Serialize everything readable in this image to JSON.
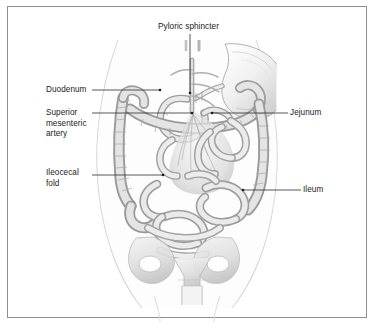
{
  "figure": {
    "kind": "anatomical-illustration",
    "style": "grayscale medical line drawing",
    "frame_color": "#8d8f92",
    "background_color": "#ffffff",
    "text_color": "#1b1b1b",
    "leader_line_color": "#3a3a3a"
  },
  "labels": {
    "pyloric_sphincter": "Pyloric sphincter",
    "duodenum": "Duodenum",
    "superior_mesenteric_artery": "Superior\nmesenteric\nartery",
    "ileocecal_fold": "Ileocecal\nfold",
    "jejunum": "Jejunum",
    "ileum": "Ileum"
  },
  "callouts": [
    {
      "name": "pyloric-sphincter",
      "side": "top",
      "label": "Pyloric sphincter",
      "point_x": 190,
      "point_y": 93
    },
    {
      "name": "duodenum",
      "side": "left",
      "label": "Duodenum",
      "point_x": 160,
      "point_y": 90
    },
    {
      "name": "superior-mesenteric-artery",
      "side": "left",
      "label": "Superior mesenteric artery",
      "point_x": 192,
      "point_y": 113
    },
    {
      "name": "ileocecal-fold",
      "side": "left",
      "label": "Ileocecal fold",
      "point_x": 163,
      "point_y": 175
    },
    {
      "name": "jejunum",
      "side": "right",
      "label": "Jejunum",
      "point_x": 212,
      "point_y": 113
    },
    {
      "name": "ileum",
      "side": "right",
      "label": "Ileum",
      "point_x": 243,
      "point_y": 190
    }
  ],
  "anatomy_parts": [
    "body-torso-outline",
    "stomach",
    "pyloric-sphincter",
    "duodenum",
    "jejunum",
    "ileum",
    "ascending-colon",
    "transverse-colon",
    "descending-colon",
    "cecum",
    "superior-mesenteric-artery",
    "mesentery",
    "pelvis-bone",
    "sacrum",
    "pubic-symphysis"
  ]
}
